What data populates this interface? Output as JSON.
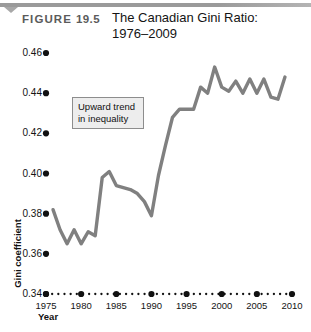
{
  "figure": {
    "label": "FIGURE",
    "number": "19.5",
    "title_line1": "The Canadian Gini Ratio:",
    "title_line2": "1976–2009"
  },
  "annotation": {
    "line1": "Upward trend",
    "line2": "in inequality"
  },
  "colors": {
    "line": "#808080",
    "axis_dot": "#111111",
    "callout_fill": "#ededed",
    "callout_border": "#8d8d8d",
    "rule": "#9a9a9a"
  },
  "chart_data": {
    "type": "line",
    "title": "The Canadian Gini Ratio: 1976–2009",
    "xlabel": "Year",
    "ylabel": "Gini coefficient",
    "xlim": [
      1975,
      2010
    ],
    "ylim": [
      0.34,
      0.46
    ],
    "grid": false,
    "legend": null,
    "x_ticks": [
      1975,
      1980,
      1985,
      1990,
      1995,
      2000,
      2005,
      2010
    ],
    "x_tick_labels": [
      "1975",
      "1980",
      "1985",
      "1990",
      "1995",
      "2000",
      "2005",
      "2010"
    ],
    "y_ticks": [
      0.34,
      0.36,
      0.38,
      0.4,
      0.42,
      0.44,
      0.46
    ],
    "y_tick_labels": [
      "0.34",
      "0.36",
      "0.38",
      "0.40",
      "0.42",
      "0.44",
      "0.46"
    ],
    "x": [
      1976,
      1977,
      1978,
      1979,
      1980,
      1981,
      1982,
      1983,
      1984,
      1985,
      1986,
      1987,
      1988,
      1989,
      1990,
      1991,
      1992,
      1993,
      1994,
      1995,
      1996,
      1997,
      1998,
      1999,
      2000,
      2001,
      2002,
      2003,
      2004,
      2005,
      2006,
      2007,
      2008,
      2009
    ],
    "values": [
      0.382,
      0.372,
      0.365,
      0.372,
      0.365,
      0.371,
      0.369,
      0.398,
      0.401,
      0.394,
      0.393,
      0.392,
      0.39,
      0.386,
      0.379,
      0.399,
      0.414,
      0.428,
      0.432,
      0.432,
      0.432,
      0.443,
      0.44,
      0.453,
      0.443,
      0.441,
      0.446,
      0.44,
      0.447,
      0.44,
      0.447,
      0.438,
      0.437,
      0.448
    ],
    "series": [
      {
        "name": "Gini coefficient",
        "values": [
          0.382,
          0.372,
          0.365,
          0.372,
          0.365,
          0.371,
          0.369,
          0.398,
          0.401,
          0.394,
          0.393,
          0.392,
          0.39,
          0.386,
          0.379,
          0.399,
          0.414,
          0.428,
          0.432,
          0.432,
          0.432,
          0.443,
          0.44,
          0.453,
          0.443,
          0.441,
          0.446,
          0.44,
          0.447,
          0.44,
          0.447,
          0.438,
          0.437,
          0.448
        ]
      }
    ]
  }
}
